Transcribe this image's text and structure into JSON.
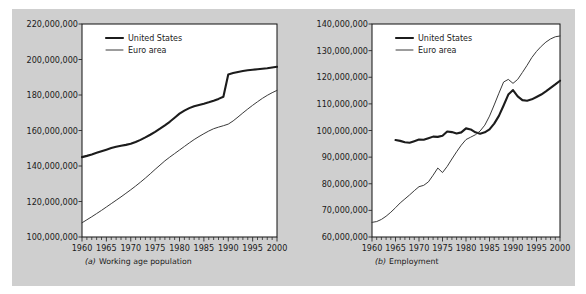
{
  "figure": {
    "background_color": "#cfcfcf",
    "panel_color": "#ffffff",
    "line_color_us": "#1c1c1c",
    "line_color_euro": "#3a3a3a"
  },
  "chart_data": [
    {
      "type": "line",
      "panel_id": "a",
      "title": "",
      "caption_marker": "(a)",
      "caption": "Working age population",
      "xlabel": "",
      "ylabel": "",
      "xlim": [
        1960,
        2000
      ],
      "ylim": [
        100000000,
        220000000
      ],
      "xticks": [
        1960,
        1965,
        1970,
        1975,
        1980,
        1985,
        1990,
        1995,
        2000
      ],
      "xticklabels": [
        "1960",
        "1965",
        "1970",
        "1975",
        "1980",
        "1985",
        "1990",
        "1995",
        "2000"
      ],
      "yticks": [
        100000000,
        120000000,
        140000000,
        160000000,
        180000000,
        200000000,
        220000000
      ],
      "yticklabels": [
        "100,000,000",
        "120,000,000",
        "140,000,000",
        "160,000,000",
        "180,000,000",
        "200,000,000",
        "220,000,000"
      ],
      "grid": false,
      "legend_position": "top-left-inside",
      "legend": [
        "United States",
        "Euro area"
      ],
      "series": [
        {
          "name": "United States",
          "x": [
            1960,
            1961,
            1962,
            1963,
            1964,
            1965,
            1966,
            1967,
            1968,
            1969,
            1970,
            1971,
            1972,
            1973,
            1974,
            1975,
            1976,
            1977,
            1978,
            1979,
            1980,
            1981,
            1982,
            1983,
            1984,
            1985,
            1986,
            1987,
            1988,
            1989,
            1990,
            1991,
            1992,
            1993,
            1994,
            1995,
            1996,
            1997,
            1998,
            1999,
            2000
          ],
          "values": [
            145000000,
            145700000,
            146500000,
            147400000,
            148300000,
            149200000,
            150100000,
            150800000,
            151400000,
            151900000,
            152500000,
            153500000,
            154700000,
            156100000,
            157600000,
            159200000,
            161000000,
            162900000,
            164900000,
            167200000,
            169500000,
            171200000,
            172600000,
            173700000,
            174400000,
            175100000,
            175900000,
            176800000,
            177800000,
            179000000,
            191600000,
            192400000,
            193000000,
            193500000,
            193900000,
            194200000,
            194500000,
            194800000,
            195100000,
            195500000,
            195900000
          ]
        },
        {
          "name": "Euro area",
          "x": [
            1960,
            1961,
            1962,
            1963,
            1964,
            1965,
            1966,
            1967,
            1968,
            1969,
            1970,
            1971,
            1972,
            1973,
            1974,
            1975,
            1976,
            1977,
            1978,
            1979,
            1980,
            1981,
            1982,
            1983,
            1984,
            1985,
            1986,
            1987,
            1988,
            1989,
            1990,
            1991,
            1992,
            1993,
            1994,
            1995,
            1996,
            1997,
            1998,
            1999,
            2000
          ],
          "values": [
            108000000,
            109700000,
            111400000,
            113200000,
            115000000,
            116900000,
            118800000,
            120700000,
            122600000,
            124600000,
            126600000,
            128700000,
            130900000,
            133200000,
            135600000,
            138100000,
            140500000,
            142900000,
            145000000,
            147000000,
            149000000,
            151000000,
            153000000,
            154900000,
            156600000,
            158200000,
            159700000,
            161000000,
            161900000,
            162700000,
            163600000,
            165400000,
            167600000,
            169900000,
            172100000,
            174200000,
            176200000,
            178100000,
            179800000,
            181300000,
            182600000
          ]
        }
      ]
    },
    {
      "type": "line",
      "panel_id": "b",
      "title": "",
      "caption_marker": "(b)",
      "caption": "Employment",
      "xlabel": "",
      "ylabel": "",
      "xlim": [
        1960,
        2000
      ],
      "ylim": [
        60000000,
        140000000
      ],
      "xticks": [
        1960,
        1965,
        1970,
        1975,
        1980,
        1985,
        1990,
        1995,
        2000
      ],
      "xticklabels": [
        "1960",
        "1965",
        "1970",
        "1975",
        "1980",
        "1985",
        "1990",
        "1995",
        "2000"
      ],
      "yticks": [
        60000000,
        70000000,
        80000000,
        90000000,
        100000000,
        110000000,
        120000000,
        130000000,
        140000000
      ],
      "yticklabels": [
        "60,000,000",
        "70,000,000",
        "80,000,000",
        "90,000,000",
        "100,000,000",
        "110,000,000",
        "120,000,000",
        "130,000,000",
        "140,000,000"
      ],
      "grid": false,
      "legend_position": "top-left-inside",
      "legend": [
        "United States",
        "Euro area"
      ],
      "series": [
        {
          "name": "United States",
          "x": [
            1965,
            1966,
            1967,
            1968,
            1969,
            1970,
            1971,
            1972,
            1973,
            1974,
            1975,
            1976,
            1977,
            1978,
            1979,
            1980,
            1981,
            1982,
            1983,
            1984,
            1985,
            1986,
            1987,
            1988,
            1989,
            1990,
            1991,
            1992,
            1993,
            1994,
            1995,
            1996,
            1997,
            1998,
            1999,
            2000
          ],
          "values": [
            96400000,
            96100000,
            95600000,
            95400000,
            96000000,
            96600000,
            96500000,
            97100000,
            97700000,
            97600000,
            98000000,
            99600000,
            99400000,
            98900000,
            99300000,
            100800000,
            100400000,
            99300000,
            98800000,
            99300000,
            100400000,
            102600000,
            105500000,
            109400000,
            113500000,
            115200000,
            112800000,
            111400000,
            111200000,
            111700000,
            112600000,
            113500000,
            114700000,
            116000000,
            117300000,
            118700000
          ]
        },
        {
          "name": "Euro area",
          "x": [
            1960,
            1961,
            1962,
            1963,
            1964,
            1965,
            1966,
            1967,
            1968,
            1969,
            1970,
            1971,
            1972,
            1973,
            1974,
            1975,
            1976,
            1977,
            1978,
            1979,
            1980,
            1981,
            1982,
            1983,
            1984,
            1985,
            1986,
            1987,
            1988,
            1989,
            1990,
            1991,
            1992,
            1993,
            1994,
            1995,
            1996,
            1997,
            1998,
            1999,
            2000
          ],
          "values": [
            65500000,
            65800000,
            66600000,
            67800000,
            69300000,
            71000000,
            72800000,
            74300000,
            75800000,
            77400000,
            78900000,
            79400000,
            80700000,
            83200000,
            85900000,
            84200000,
            86500000,
            89300000,
            92000000,
            94500000,
            96600000,
            97500000,
            98400000,
            99800000,
            102000000,
            105400000,
            109600000,
            114000000,
            118200000,
            119200000,
            117700000,
            119200000,
            121800000,
            124500000,
            127400000,
            129700000,
            131600000,
            133200000,
            134400000,
            135200000,
            135500000
          ]
        }
      ]
    }
  ]
}
